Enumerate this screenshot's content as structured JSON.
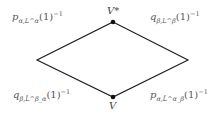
{
  "diagram": {
    "type": "commutative-diamond",
    "line_color": "#222222",
    "text_color": "#555555",
    "vertices": {
      "top": {
        "label": "V*"
      },
      "bottom": {
        "label": "V"
      },
      "left": {
        "label": ""
      },
      "right": {
        "label": ""
      }
    },
    "edges": {
      "top_left": {
        "symbol": "p",
        "sub": "α,L^α",
        "value": "(1)",
        "sup": "−1"
      },
      "top_right": {
        "symbol": "q",
        "sub": "β,L^β",
        "value": "(1)",
        "sup": "−1"
      },
      "bottom_left": {
        "symbol": "q",
        "sub": "β,L̃^β_α",
        "value": "(1)",
        "sup": "−1"
      },
      "bottom_right": {
        "symbol": "p",
        "sub": "α,L̃^α_β",
        "value": "(1)",
        "sup": "−1"
      }
    }
  }
}
